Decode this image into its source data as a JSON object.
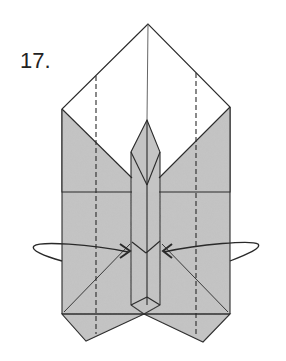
{
  "diagram": {
    "step_number": "17.",
    "colors": {
      "paper_colored": "#c4c4c4",
      "paper_white": "#ffffff",
      "line": "#2a2a2a"
    },
    "elements": {
      "top_flap": "white diamond top with central crease",
      "side_panels": "gray panels with diagonal edges",
      "center_strip": "narrow pointed vertical strip",
      "fold_lines": "two vertical dashed valley-fold lines",
      "arrows": "two curved arrows pointing inward toward center (squash/fold behind)",
      "bottom_points": "two triangular points at the bottom"
    }
  }
}
